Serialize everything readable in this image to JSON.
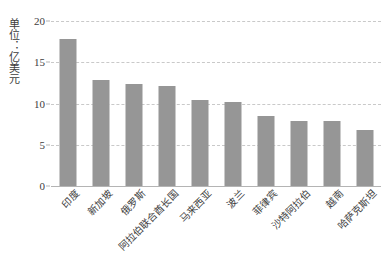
{
  "chart_data": {
    "type": "bar",
    "title": "",
    "subtitle": "",
    "xlabel": "",
    "ylabel": "单位：亿美元",
    "ylim": [
      0,
      20
    ],
    "yticks": [
      0,
      5,
      10,
      15,
      20
    ],
    "grid": true,
    "legend": "none",
    "bar_color": "#969696",
    "gridline_color": "#c9c9c9",
    "axis_color": "#b4b4b4",
    "categories": [
      "印度",
      "新加坡",
      "俄罗斯",
      "阿拉伯联合酋长国",
      "马来西亚",
      "波兰",
      "菲律宾",
      "沙特阿拉伯",
      "越南",
      "哈萨克斯坦"
    ],
    "values": [
      17.8,
      12.8,
      12.4,
      12.1,
      10.4,
      10.2,
      8.5,
      7.9,
      7.9,
      6.8
    ]
  }
}
